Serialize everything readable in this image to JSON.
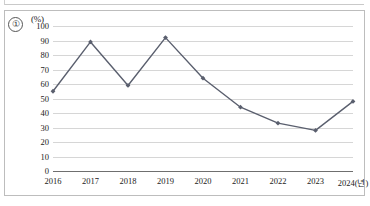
{
  "figure": {
    "item_number": "①",
    "unit_label": "(%)"
  },
  "chart_data": {
    "type": "line",
    "title": "",
    "subtitle": "",
    "xlabel": "",
    "ylabel": "(%)",
    "categories": [
      "2016",
      "2017",
      "2018",
      "2019",
      "2020",
      "2021",
      "2022",
      "2023",
      "2024(년)"
    ],
    "x_tick_labels": [
      "2016",
      "2017",
      "2018",
      "2019",
      "2020",
      "2021",
      "2022",
      "2023",
      "2024(년)"
    ],
    "values": [
      55,
      89,
      59,
      92,
      64,
      44,
      33,
      28,
      48
    ],
    "series": [
      {
        "name": "",
        "values": [
          55,
          89,
          59,
          92,
          64,
          44,
          33,
          28,
          48
        ],
        "color": "#5a5f6e",
        "marker": "diamond"
      }
    ],
    "ylim": [
      0,
      100
    ],
    "y_ticks": [
      0,
      10,
      20,
      30,
      40,
      50,
      60,
      70,
      80,
      90,
      100
    ],
    "y_tick_labels": [
      "0",
      "10",
      "20",
      "30",
      "40",
      "50",
      "60",
      "70",
      "80",
      "90",
      "100"
    ],
    "grid": true,
    "grid_axis": "y",
    "legend": false,
    "legend_position": "none",
    "line_color": "#5a5f6e",
    "grid_color": "#d6d6d6",
    "axis_color": "#6f6f6f"
  }
}
